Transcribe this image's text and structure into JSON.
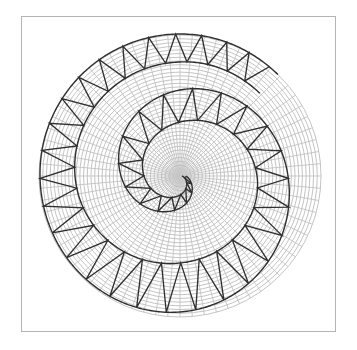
{
  "figure": {
    "caption": "Spiral zigzag band over polar grid",
    "frame": {
      "x": 21,
      "y": 16,
      "width": 316,
      "height": 317,
      "stroke": "#b4b4b4"
    },
    "center": {
      "x": 180,
      "y": 176
    },
    "polar_grid": {
      "outer_radius": 141,
      "ring_count": 38,
      "radial_line_count": 72,
      "stroke": "#bdbdbd",
      "stroke_width": 0.9
    },
    "spiral_band": {
      "stroke": "#2f2f2f",
      "stroke_width": 1.4,
      "direction": "clockwise-outward",
      "samples": [
        {
          "theta_deg": 0,
          "r_inner": 2,
          "r_outer": 6
        },
        {
          "theta_deg": 90,
          "r_inner": 19,
          "r_outer": 32
        },
        {
          "theta_deg": 180,
          "r_inner": 36,
          "r_outer": 59
        },
        {
          "theta_deg": 270,
          "r_inner": 54,
          "r_outer": 86
        },
        {
          "theta_deg": 360,
          "r_inner": 77,
          "r_outer": 108
        },
        {
          "theta_deg": 450,
          "r_inner": 87,
          "r_outer": 136
        },
        {
          "theta_deg": 540,
          "r_inner": 105,
          "r_outer": 140
        },
        {
          "theta_deg": 630,
          "r_inner": 114,
          "r_outer": 142
        },
        {
          "theta_deg": 674,
          "r_inner": 115,
          "r_outer": 141
        }
      ],
      "zigzag_tooth_spacing_px": 24
    }
  }
}
